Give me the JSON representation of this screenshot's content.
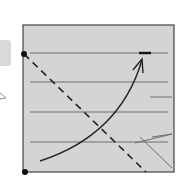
{
  "diagram": {
    "background": "#ffffff",
    "panel": {
      "x": 23,
      "y": 25,
      "width": 151,
      "height": 147,
      "fill": "#d4d4d4",
      "stroke": "#444444"
    },
    "colors": {
      "line": "#6e6e6e",
      "dark": "#222222",
      "side_tab": "#d9d9d9"
    },
    "horizontal_lines": [
      {
        "x1": 30,
        "x2": 168,
        "y": 53
      },
      {
        "x1": 30,
        "x2": 168,
        "y": 82
      },
      {
        "x1": 30,
        "x2": 168,
        "y": 112
      },
      {
        "x1": 30,
        "x2": 168,
        "y": 142
      }
    ],
    "short_line": {
      "x1": 150,
      "x2": 172,
      "y": 97
    },
    "nodes": [
      {
        "cx": 24,
        "cy": 54
      },
      {
        "cx": 25,
        "cy": 172
      }
    ],
    "dashed_line": {
      "x1": 24,
      "y1": 54,
      "x2": 146,
      "y2": 172
    },
    "curve": {
      "d": "M40 161 Q 120 135 142 60"
    },
    "marker_bar": {
      "x1": 139,
      "x2": 151,
      "y": 53
    },
    "cross_lines": [
      {
        "x1": 135,
        "y1": 143,
        "x2": 172,
        "y2": 134
      },
      {
        "x1": 152,
        "y1": 137,
        "x2": 172,
        "y2": 134
      },
      {
        "x1": 140,
        "y1": 137,
        "x2": 172,
        "y2": 168
      }
    ]
  }
}
